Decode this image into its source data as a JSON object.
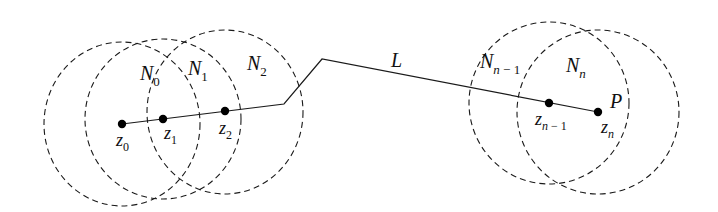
{
  "diagram": {
    "neighborhoods": [
      {
        "label": "N",
        "sub": "0",
        "cx": 122,
        "cy": 124,
        "rx": 78,
        "ry": 82,
        "label_x": 140,
        "label_y": 80
      },
      {
        "label": "N",
        "sub": "1",
        "cx": 163,
        "cy": 119,
        "rx": 78,
        "ry": 80,
        "label_x": 188,
        "label_y": 75
      },
      {
        "label": "N",
        "sub": "2",
        "cx": 225,
        "cy": 112,
        "rx": 78,
        "ry": 82,
        "label_x": 247,
        "label_y": 70
      },
      {
        "label": "N",
        "sub": "n − 1",
        "cx": 549,
        "cy": 103,
        "rx": 80,
        "ry": 81,
        "label_x": 480,
        "label_y": 68
      },
      {
        "label": "N",
        "sub": "n",
        "cx": 598,
        "cy": 112,
        "rx": 81,
        "ry": 82,
        "label_x": 566,
        "label_y": 72
      }
    ],
    "points": [
      {
        "label": "z",
        "sub": "0",
        "x": 122,
        "y": 124,
        "label_x": 116,
        "label_y": 146
      },
      {
        "label": "z",
        "sub": "1",
        "x": 163,
        "y": 119,
        "label_x": 164,
        "label_y": 139
      },
      {
        "label": "z",
        "sub": "2",
        "x": 225,
        "y": 111,
        "label_x": 219,
        "label_y": 134
      },
      {
        "label": "z",
        "sub": "n − 1",
        "x": 549,
        "y": 103,
        "label_x": 535,
        "label_y": 125
      },
      {
        "label": "z",
        "sub": "n",
        "x": 598,
        "y": 112,
        "label_x": 601,
        "label_y": 133
      }
    ],
    "path": {
      "label": "L",
      "label_x": 391,
      "label_y": 67,
      "vertices": [
        [
          122,
          124
        ],
        [
          284,
          104
        ],
        [
          322,
          59
        ],
        [
          598,
          112
        ]
      ]
    },
    "endpoint_label": {
      "text": "P",
      "x": 610,
      "y": 108
    }
  }
}
